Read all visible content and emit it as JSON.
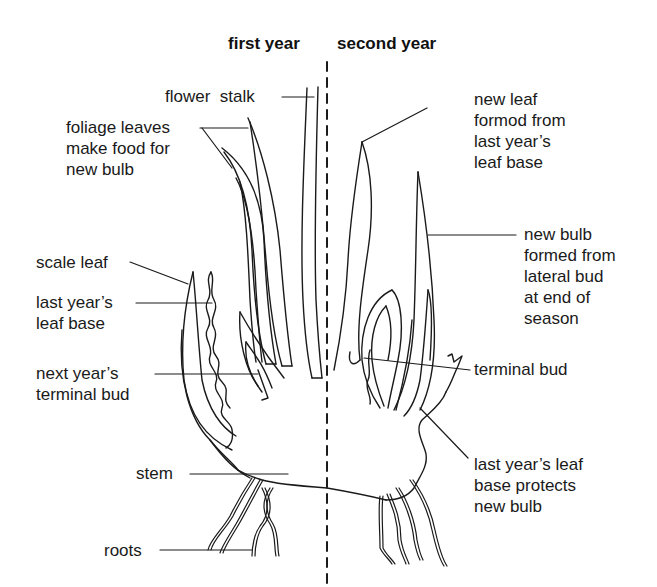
{
  "diagram": {
    "headings": {
      "first_year": "first year",
      "second_year": "second year"
    },
    "labels_left": {
      "flower_stalk": "flower  stalk",
      "foliage_leaves": "foliage leaves\nmake food for\nnew bulb",
      "scale_leaf": "scale leaf",
      "last_years_leaf_base": "last year’s\nleaf base",
      "next_years_terminal_bud": "next year’s\nterminal bud",
      "stem": "stem",
      "roots": "roots"
    },
    "labels_right": {
      "new_leaf": "new leaf\nformod from\nlast year’s\nleaf base",
      "new_bulb": "new bulb\nformed from\nlateral bud\nat end of\nseason",
      "terminal_bud": "terminal bud",
      "last_years_leaf_base_protects": "last year’s leaf\nbase protects\nnew bulb"
    },
    "colors": {
      "ink": "#1a1a1a",
      "background": "#ffffff"
    }
  }
}
